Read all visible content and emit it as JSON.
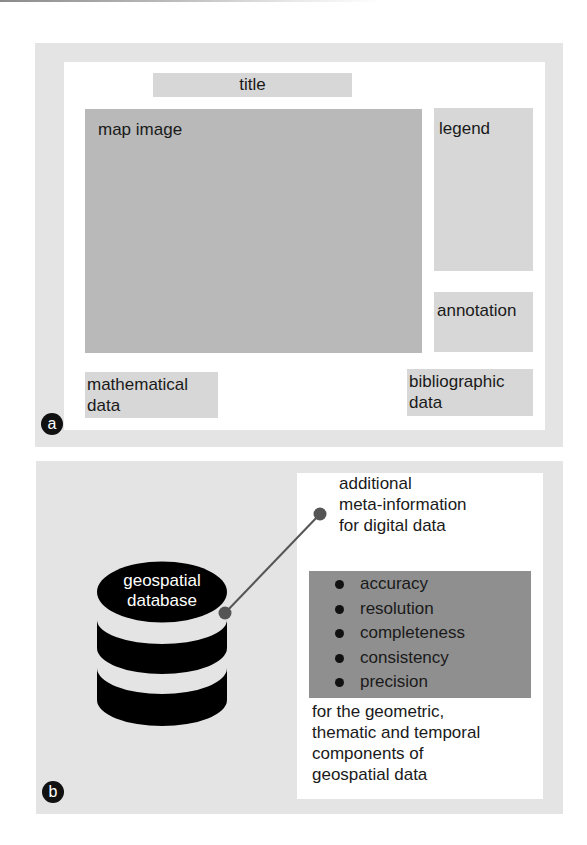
{
  "panel_a": {
    "badge": "a",
    "title_box": "title",
    "map_image": "map image",
    "legend": "legend",
    "annotation": "annotation",
    "mathematical_data": "mathematical\ndata",
    "bibliographic_data": "bibliographic\ndata"
  },
  "panel_b": {
    "badge": "b",
    "database_label": "geospatial\ndatabase",
    "callout_heading": "additional\nmeta-information\nfor digital data",
    "quality_items": [
      {
        "label": "accuracy"
      },
      {
        "label": "resolution"
      },
      {
        "label": "completeness"
      },
      {
        "label": "consistency"
      },
      {
        "label": "precision"
      }
    ],
    "footer_text": "for the geometric,\nthematic and temporal\ncomponents of\ngeospatial data"
  },
  "colors": {
    "outer_panel": "#e4e4e4",
    "light_box": "#d7d7d7",
    "map_box": "#b9b9b9",
    "list_box": "#8f8f8f",
    "database": "#000000",
    "connector": "#555555"
  }
}
